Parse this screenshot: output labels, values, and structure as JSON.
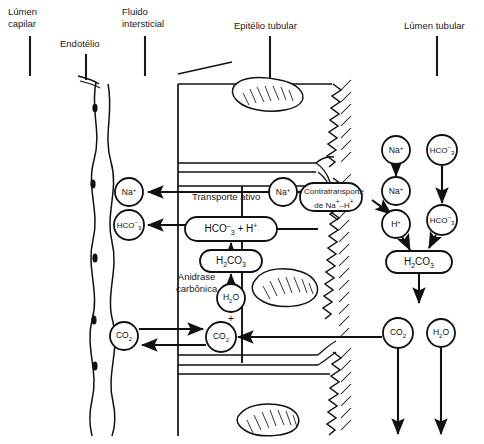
{
  "diagram": {
    "topLabels": [
      {
        "id": "lumen-capilar",
        "line1": "Lúmen",
        "line2": "capilar",
        "x": 8,
        "y": 8,
        "tickX": 30,
        "tickY1": 36,
        "tickY2": 76
      },
      {
        "id": "endotelio",
        "line1": "Endotélio",
        "line2": "",
        "x": 60,
        "y": 40,
        "tickX": 86,
        "tickY1": 54,
        "tickY2": 80
      },
      {
        "id": "fluido-intersticial",
        "line1": "Fluido",
        "line2": "intersticial",
        "x": 122,
        "y": 8,
        "tickX": 145,
        "tickY1": 36,
        "tickY2": 76
      },
      {
        "id": "epitelio-tubular",
        "line1": "Epitélio tubular",
        "line2": "",
        "x": 234,
        "y": 22,
        "tickX": 270,
        "tickY1": 36,
        "tickY2": 82
      },
      {
        "id": "lumen-tubular",
        "line1": "Lúmen tubular",
        "line2": "",
        "x": 404,
        "y": 22,
        "tickX": 437,
        "tickY1": 36,
        "tickY2": 76
      }
    ],
    "processLabels": [
      {
        "id": "transporte-ativo",
        "text": "Transporte ativo",
        "x": 192,
        "y": 196
      },
      {
        "id": "anidrase-carbonica-l1",
        "text": "Anidrase",
        "x": 183,
        "y": 276
      },
      {
        "id": "anidrase-carbonica-l2",
        "text": "carbônica",
        "x": 180,
        "y": 287
      },
      {
        "id": "contratransporte-l1",
        "text": "Contratransporte",
        "x": 311,
        "y": 194
      },
      {
        "id": "contratransporte-l2",
        "text": "de Na",
        "x": 317,
        "y": 205
      },
      {
        "id": "plus-minus-na-h",
        "text": "–H",
        "x": 0,
        "y": 0
      }
    ],
    "counterTransport": {
      "label_line1": "Contratransporte",
      "label_line2_pre": "de Na",
      "label_line2_sup1": "+",
      "label_line2_mid": "–H",
      "label_line2_sup2": "+"
    },
    "nodes": [
      {
        "id": "cap-na",
        "kind": "circle",
        "label": "Na",
        "sup": "+",
        "sub": "",
        "cx": 129,
        "cy": 192,
        "r": 14
      },
      {
        "id": "cap-hco3",
        "kind": "circle",
        "label": "HCO",
        "sup": "–",
        "sub": "3",
        "cx": 129,
        "cy": 225,
        "r": 15
      },
      {
        "id": "cap-co2",
        "kind": "circle",
        "label": "CO",
        "sup": "",
        "sub": "2",
        "cx": 124,
        "cy": 336,
        "r": 14
      },
      {
        "id": "cell-na",
        "kind": "circle",
        "label": "Na",
        "sup": "+",
        "sub": "",
        "cx": 283,
        "cy": 192,
        "r": 14
      },
      {
        "id": "cell-hco3-h",
        "kind": "rounded",
        "label": "HCO",
        "sup": "–",
        "sub": "3",
        "suffix": " + H",
        "suffix_sup": "+",
        "cx": 231,
        "cy": 229,
        "w": 92,
        "h": 24
      },
      {
        "id": "cell-h2co3",
        "kind": "rounded",
        "label": "H",
        "sub": "2",
        "label2": "CO",
        "sub2": "3",
        "cx": 231,
        "cy": 261,
        "w": 62,
        "h": 22
      },
      {
        "id": "cell-h2o",
        "kind": "circle",
        "label": "H",
        "sub": "2",
        "label2": "O",
        "cx": 231,
        "cy": 298,
        "r": 14
      },
      {
        "id": "cell-plus",
        "kind": "text",
        "label": "+",
        "cx": 231,
        "cy": 318
      },
      {
        "id": "cell-co2",
        "kind": "circle",
        "label": "CO",
        "sub": "2",
        "cx": 221,
        "cy": 337,
        "r": 15
      },
      {
        "id": "lum-na-top",
        "kind": "circle",
        "label": "Na",
        "sup": "+",
        "cx": 396,
        "cy": 150,
        "r": 14
      },
      {
        "id": "lum-na-mid",
        "kind": "circle",
        "label": "Na",
        "sup": "+",
        "cx": 396,
        "cy": 191,
        "r": 14
      },
      {
        "id": "lum-h",
        "kind": "circle",
        "label": "H",
        "sup": "+",
        "cx": 396,
        "cy": 224,
        "r": 14
      },
      {
        "id": "lum-hco3-top",
        "kind": "circle",
        "label": "HCO",
        "sup": "–",
        "sub": "3",
        "cx": 442,
        "cy": 150,
        "r": 15
      },
      {
        "id": "lum-hco3-mid",
        "kind": "circle",
        "label": "HCO",
        "sup": "–",
        "sub": "3",
        "cx": 442,
        "cy": 220,
        "r": 15
      },
      {
        "id": "lum-h2co3",
        "kind": "rounded",
        "label": "H",
        "sub": "2",
        "label2": "CO",
        "sub2": "3",
        "cx": 419,
        "cy": 262,
        "w": 66,
        "h": 22
      },
      {
        "id": "lum-co2",
        "kind": "circle",
        "label": "CO",
        "sub": "2",
        "cx": 398,
        "cy": 333,
        "r": 15
      },
      {
        "id": "lum-h2o",
        "kind": "circle",
        "label": "H",
        "sub": "2",
        "label2": "O",
        "cx": 441,
        "cy": 333,
        "r": 14
      }
    ],
    "colors": {
      "ink": "#1a1a1a",
      "stroke": "#111111",
      "background": "#ffffff"
    }
  }
}
